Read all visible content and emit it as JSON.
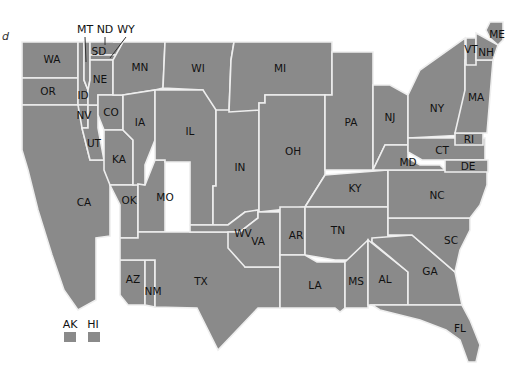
{
  "map": {
    "type": "US state cartogram (schematic)",
    "fill_color": "#8a8a8a",
    "border_color": "#eeeeee",
    "label_color": "#111111",
    "corner_fragment": "d",
    "states": {
      "WA": "WA",
      "OR": "OR",
      "CA": "CA",
      "ID": "ID",
      "NV": "NV",
      "UT": "UT",
      "MT": "MT",
      "ND": "ND",
      "WY": "WY",
      "SD": "SD",
      "NE": "NE",
      "CO": "CO",
      "KA": "KA",
      "OK": "OK",
      "AZ": "AZ",
      "NM": "NM",
      "TX": "TX",
      "MN": "MN",
      "IA": "IA",
      "MO": "MO",
      "WI": "WI",
      "IL": "IL",
      "IN": "IN",
      "MI": "MI",
      "OH": "OH",
      "WV": "WV",
      "VA": "VA",
      "KY": "KY",
      "TN": "TN",
      "AR": "AR",
      "LA": "LA",
      "MS": "MS",
      "AL": "AL",
      "GA": "GA",
      "FL": "FL",
      "SC": "SC",
      "NC": "NC",
      "PA": "PA",
      "NJ": "NJ",
      "NY": "NY",
      "MD": "MD",
      "DE": "DE",
      "CT": "CT",
      "RI": "RI",
      "MA": "MA",
      "VT": "VT",
      "NH": "NH",
      "ME": "ME"
    },
    "callouts": [
      "MT",
      "ND",
      "WY"
    ],
    "legend": [
      {
        "label": "AK"
      },
      {
        "label": "HI"
      }
    ]
  }
}
